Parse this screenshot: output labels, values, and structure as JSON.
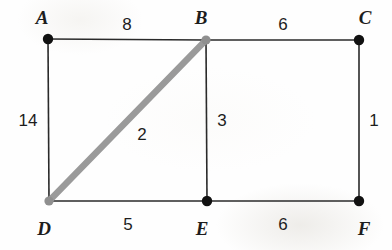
{
  "figure": {
    "type": "geometry-diagram",
    "shape": "rectangle-grid-with-diagonal",
    "canvas": {
      "width": 392,
      "height": 250
    },
    "background_color": "#fefefe",
    "edge_color": "#2a2a2a",
    "diagonal_color": "#9a9a9a",
    "vertex_color": "#111111",
    "vertex_color_gray": "#8f8f8f"
  },
  "vertices": [
    {
      "id": "A",
      "label": "A",
      "x": 48,
      "y": 39,
      "dot_color": "#111111",
      "label_x": 42,
      "label_y": 17
    },
    {
      "id": "B",
      "label": "B",
      "x": 206,
      "y": 40,
      "dot_color": "#8f8f8f",
      "label_x": 201,
      "label_y": 17
    },
    {
      "id": "C",
      "label": "C",
      "x": 359,
      "y": 40,
      "dot_color": "#111111",
      "label_x": 365,
      "label_y": 17
    },
    {
      "id": "D",
      "label": "D",
      "x": 49,
      "y": 201,
      "dot_color": "#8f8f8f",
      "label_x": 44,
      "label_y": 228
    },
    {
      "id": "E",
      "label": "E",
      "x": 207,
      "y": 201,
      "dot_color": "#111111",
      "label_x": 202,
      "label_y": 228
    },
    {
      "id": "F",
      "label": "F",
      "x": 359,
      "y": 201,
      "dot_color": "#111111",
      "label_x": 364,
      "label_y": 228
    }
  ],
  "edges": [
    {
      "id": "AB",
      "from": "A",
      "to": "B",
      "weight": "8",
      "style": "solid-black",
      "label_x": 127,
      "label_y": 24
    },
    {
      "id": "BC",
      "from": "B",
      "to": "C",
      "weight": "6",
      "style": "solid-black",
      "label_x": 283,
      "label_y": 24
    },
    {
      "id": "AD",
      "from": "A",
      "to": "D",
      "weight": "14",
      "style": "solid-black",
      "label_x": 28,
      "label_y": 120
    },
    {
      "id": "BE",
      "from": "B",
      "to": "E",
      "weight": "3",
      "style": "solid-black",
      "label_x": 222,
      "label_y": 120
    },
    {
      "id": "CF",
      "from": "C",
      "to": "F",
      "weight": "1",
      "style": "solid-black",
      "label_x": 374,
      "label_y": 120
    },
    {
      "id": "DE",
      "from": "D",
      "to": "E",
      "weight": "5",
      "style": "solid-black",
      "label_x": 128,
      "label_y": 224
    },
    {
      "id": "EF",
      "from": "E",
      "to": "F",
      "weight": "6",
      "style": "solid-black",
      "label_x": 283,
      "label_y": 224
    },
    {
      "id": "DB",
      "from": "D",
      "to": "B",
      "weight": "2",
      "style": "thick-gray",
      "label_x": 142,
      "label_y": 134
    }
  ]
}
